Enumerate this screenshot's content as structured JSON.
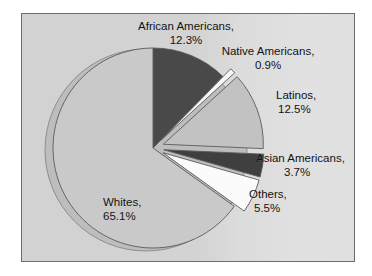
{
  "figure": {
    "background_color": "#d2d2d2",
    "frame_color": "#6d6d6d",
    "watermark": "PHOTO"
  },
  "chart_data": {
    "type": "pie",
    "title": "",
    "subtitle": "",
    "xlabel": "",
    "ylabel": "",
    "legend_position": "none",
    "grid": false,
    "units": "percent",
    "total": 100.0,
    "start_angle_deg": 0,
    "direction": "clockwise",
    "categories": [
      "Whites",
      "African Americans",
      "Native Americans",
      "Latinos",
      "Asian Americans",
      "Others"
    ],
    "values": [
      65.1,
      12.3,
      0.9,
      12.5,
      3.7,
      5.5
    ],
    "labels": [
      "Whites, 65.1%",
      "African Americans, 12.3%",
      "Native Americans, 0.9%",
      "Latinos, 12.5%",
      "Asian Americans, 3.7%",
      "Others, 5.5%"
    ],
    "slices": [
      {
        "name": "african-americans",
        "label_line1": "African Americans,",
        "label_line2": "12.3%",
        "value": 12.3,
        "color": "#494949",
        "exploded": false
      },
      {
        "name": "native-americans",
        "label_line1": "Native Americans,",
        "label_line2": "0.9%",
        "value": 0.9,
        "color": "#f6f6f6",
        "exploded": true
      },
      {
        "name": "latinos",
        "label_line1": "Latinos,",
        "label_line2": "12.5%",
        "value": 12.5,
        "color": "#c2c2c2",
        "exploded": true
      },
      {
        "name": "asian-americans",
        "label_line1": "Asian Americans,",
        "label_line2": "3.7%",
        "value": 3.7,
        "color": "#3f3f3f",
        "exploded": true
      },
      {
        "name": "others",
        "label_line1": "Others,",
        "label_line2": "5.5%",
        "value": 5.5,
        "color": "#fbfbfb",
        "exploded": true
      },
      {
        "name": "whites",
        "label_line1": "Whites,",
        "label_line2": "65.1%",
        "value": 65.1,
        "color": "#c9c9c9",
        "exploded": false
      }
    ]
  }
}
